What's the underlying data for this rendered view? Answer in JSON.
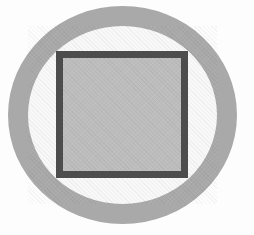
{
  "figure": {
    "shapes": [
      {
        "name": "outer-ring",
        "type": "ellipse-ring",
        "stroke_color": "#a9a9a9",
        "fill_color": "#f8f8f8",
        "stroke_width_px": 20
      },
      {
        "name": "inner-square",
        "type": "rectangle",
        "stroke_color": "#4d4d4d",
        "fill_color": "#bdbdbd",
        "stroke_width_px": 7
      }
    ],
    "colors": {
      "background": "#fdfdfd",
      "ring": "#a9a9a9",
      "square_border": "#4d4d4d",
      "square_fill": "#bdbdbd"
    }
  }
}
